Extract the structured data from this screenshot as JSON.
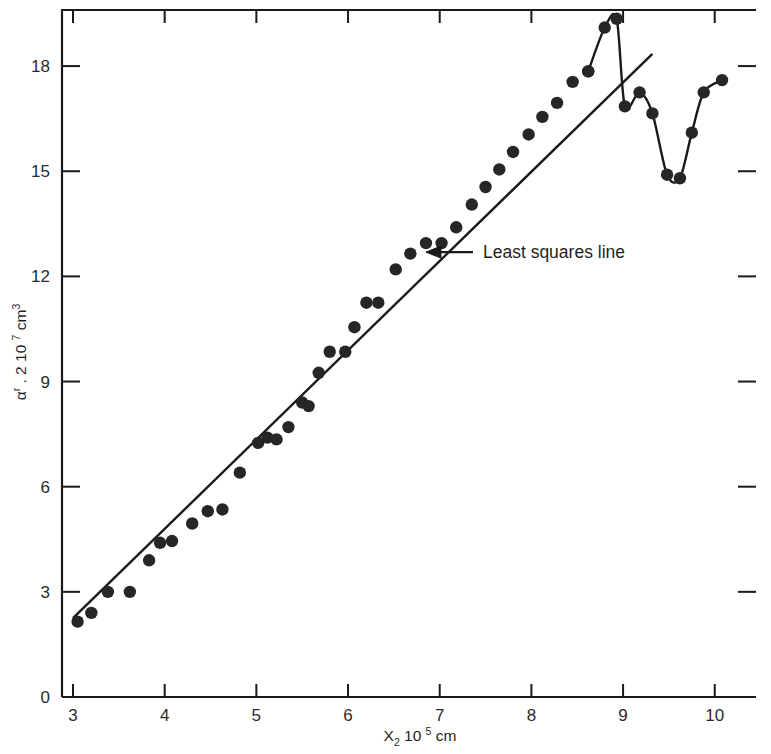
{
  "chart_data": {
    "type": "scatter",
    "title": "",
    "xlabel": "X_2 10^5 cm",
    "ylabel": "alpha_r . 2 10^7 cm^3",
    "xlabel_parts": {
      "base": "X",
      "sub": "2",
      "mid": " 10 ",
      "sup": "5",
      "tail": " cm"
    },
    "ylabel_parts": {
      "base": "α",
      "sub": "r",
      "mid": " . 2 10 ",
      "sup": "7",
      "tail": " cm",
      "tail_sup": "3"
    },
    "xlim": [
      2.88,
      10.45
    ],
    "ylim": [
      0,
      19.6
    ],
    "xticks": [
      3,
      4,
      5,
      6,
      7,
      8,
      9,
      10
    ],
    "xtick_labels": [
      "3",
      "4",
      "5",
      "6",
      "7",
      "8",
      "9",
      "10"
    ],
    "yticks": [
      0,
      3,
      6,
      9,
      12,
      15,
      18
    ],
    "ytick_labels": [
      "0",
      "3",
      "6",
      "9",
      "12",
      "15",
      "18"
    ],
    "grid": false,
    "legend": "none",
    "mirror_ticks": true,
    "marker_color": "#262626",
    "line_color": "#1a1a1a",
    "axis_color": "#1a1a1a",
    "annotations": [
      {
        "text": "Least squares line",
        "x": 7.45,
        "y": 12.55,
        "arrow_to_x": 6.85,
        "arrow_to_y": 12.55,
        "name": "least-squares-line-annotation"
      }
    ],
    "series": [
      {
        "name": "measured points",
        "style": "markers",
        "points": [
          [
            3.05,
            2.15
          ],
          [
            3.2,
            2.4
          ],
          [
            3.38,
            3.0
          ],
          [
            3.62,
            3.0
          ],
          [
            3.83,
            3.9
          ],
          [
            3.95,
            4.4
          ],
          [
            4.08,
            4.45
          ],
          [
            4.3,
            4.95
          ],
          [
            4.47,
            5.3
          ],
          [
            4.63,
            5.35
          ],
          [
            4.82,
            6.4
          ],
          [
            5.02,
            7.25
          ],
          [
            5.12,
            7.4
          ],
          [
            5.22,
            7.35
          ],
          [
            5.35,
            7.7
          ],
          [
            5.5,
            8.4
          ],
          [
            5.57,
            8.3
          ],
          [
            5.68,
            9.25
          ],
          [
            5.8,
            9.85
          ],
          [
            5.97,
            9.85
          ],
          [
            6.07,
            10.55
          ],
          [
            6.2,
            11.25
          ],
          [
            6.33,
            11.25
          ],
          [
            6.52,
            12.2
          ],
          [
            6.68,
            12.65
          ],
          [
            6.85,
            12.95
          ],
          [
            7.02,
            12.95
          ],
          [
            7.18,
            13.4
          ],
          [
            7.35,
            14.05
          ],
          [
            7.5,
            14.55
          ],
          [
            7.65,
            15.05
          ],
          [
            7.8,
            15.55
          ],
          [
            7.97,
            16.05
          ],
          [
            8.12,
            16.55
          ],
          [
            8.28,
            16.95
          ],
          [
            8.45,
            17.55
          ],
          [
            8.62,
            17.85
          ]
        ]
      },
      {
        "name": "oscillation curve",
        "style": "markers+line",
        "points": [
          [
            8.62,
            17.85
          ],
          [
            8.8,
            19.1
          ],
          [
            8.93,
            19.35
          ],
          [
            9.02,
            16.85
          ],
          [
            9.18,
            17.25
          ],
          [
            9.32,
            16.65
          ],
          [
            9.48,
            14.9
          ],
          [
            9.62,
            14.8
          ],
          [
            9.75,
            16.1
          ],
          [
            9.88,
            17.25
          ],
          [
            10.08,
            17.6
          ]
        ]
      }
    ],
    "fit_line": {
      "name": "least squares line",
      "x_start": 3.0,
      "y_start": 2.25,
      "x_end": 9.32,
      "y_end": 18.35
    }
  }
}
